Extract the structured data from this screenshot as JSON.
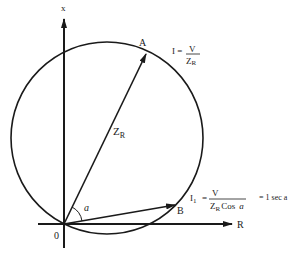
{
  "diagram": {
    "axes": {
      "vertical_label": "x",
      "horizontal_label": "R",
      "origin_label": "0"
    },
    "points": {
      "A": "A",
      "B": "B"
    },
    "vector_label": {
      "main": "Z",
      "sub": "R"
    },
    "angle_label": "a",
    "formula_I": {
      "lhs": "I =",
      "numerator": "V",
      "denominator_main": "Z",
      "denominator_sub": "R"
    },
    "formula_I1": {
      "lhs_main": "I",
      "lhs_sub": "1",
      "equals": "=",
      "numerator": "V",
      "denominator_main": "Z",
      "denominator_sub": "R",
      "denominator_tail": "Cos",
      "denominator_angle": "a",
      "rhs": "= 1 sec a"
    },
    "colors": {
      "ink": "#1a1a1a",
      "background": "#ffffff"
    }
  }
}
